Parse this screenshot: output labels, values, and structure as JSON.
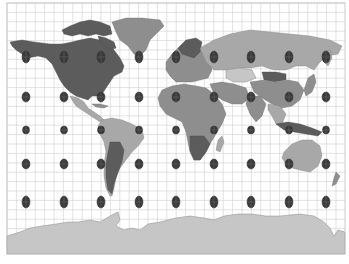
{
  "map": {
    "projection": "Mercator",
    "overlay": "Tissot's indicatrix",
    "frame": {
      "x": 7,
      "y": 3,
      "width": 338,
      "height": 251
    },
    "graticule": {
      "spacing_px": 9.4,
      "color": "#cfcfcf"
    },
    "colors": {
      "background": "#ffffff",
      "land_dark": "#5c5c5c",
      "land_mid": "#8e8e8e",
      "land_light": "#a8a8a8",
      "antarctica": "#c6c6c6",
      "indicatrix": "#3a3a3a"
    },
    "indicatrix": {
      "columns_x": [
        26,
        64,
        101,
        139,
        176,
        214,
        251,
        289,
        326
      ],
      "rows": [
        {
          "y": 57,
          "rx": 4,
          "ry": 6
        },
        {
          "y": 97,
          "rx": 4,
          "ry": 5
        },
        {
          "y": 130,
          "rx": 3.5,
          "ry": 4
        },
        {
          "y": 164,
          "rx": 4,
          "ry": 5
        },
        {
          "y": 202,
          "rx": 4,
          "ry": 6
        }
      ]
    },
    "regions": [
      "North America",
      "Greenland",
      "South America",
      "Europe",
      "Africa",
      "Asia",
      "Australia",
      "New Zealand",
      "Antarctica"
    ]
  }
}
